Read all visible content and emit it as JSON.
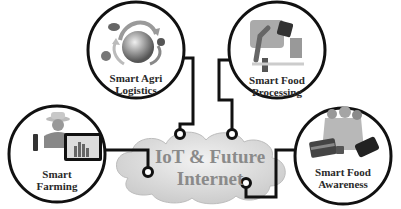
{
  "diagram": {
    "center": {
      "line1": "IoT & Future",
      "line2": "Internet",
      "shape": "cloud"
    },
    "nodes": [
      {
        "id": "smart-agri-logistics",
        "line1": "Smart Agri",
        "line2": "Logistics",
        "icon": "globe-with-arrows-icon"
      },
      {
        "id": "smart-food-processing",
        "line1": "Smart Food",
        "line2": "Processing",
        "icon": "robot-arm-factory-icon"
      },
      {
        "id": "smart-farming",
        "line1": "Smart",
        "line2": "Farming",
        "icon": "farmer-with-tablet-icon"
      },
      {
        "id": "smart-food-awareness",
        "line1": "Smart Food",
        "line2": "Awareness",
        "icon": "grocery-bag-card-phone-icon"
      }
    ],
    "colors": {
      "stroke": "#111111",
      "cloud_fill": "#e4e4e4",
      "cloud_text": "#8a8a8a",
      "node_text": "#2a2a2a"
    }
  }
}
